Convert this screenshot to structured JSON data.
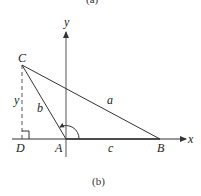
{
  "top_caption": "(a)",
  "caption": "(b)",
  "axes": {
    "x_label": "x",
    "y_label": "y"
  },
  "points": {
    "A": {
      "label": "A"
    },
    "B": {
      "label": "B"
    },
    "C": {
      "label": "C"
    },
    "D": {
      "label": "D"
    }
  },
  "sides": {
    "a": "a",
    "b": "b",
    "c": "c",
    "height": "y"
  },
  "colors": {
    "line": "#333333",
    "background": "#ffffff"
  }
}
